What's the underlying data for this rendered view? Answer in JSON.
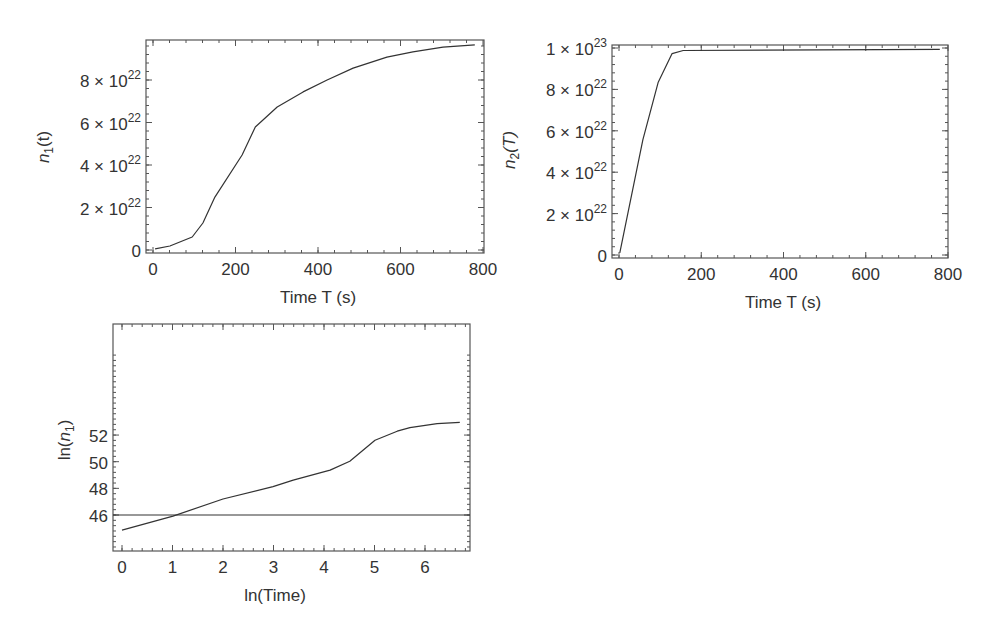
{
  "chart_data": [
    {
      "id": "n1",
      "type": "line",
      "title": "",
      "xlabel": "Time T (s)",
      "ylabel": "n1(t)",
      "ylabel_main": "n",
      "ylabel_sub": "1",
      "ylabel_tail": "(t)",
      "xlim": [
        0,
        800
      ],
      "ylim": [
        0,
        1e+23
      ],
      "xticks": [
        0,
        200,
        400,
        600,
        800
      ],
      "xtick_labels": [
        "0",
        "200",
        "400",
        "600",
        "800"
      ],
      "yticks": [
        0,
        2e+22,
        4e+22,
        6e+22,
        8e+22
      ],
      "ytick_labels": [
        {
          "mant": "0",
          "exp": ""
        },
        {
          "mant": "2 × 10",
          "exp": "22"
        },
        {
          "mant": "4 × 10",
          "exp": "22"
        },
        {
          "mant": "6 × 10",
          "exp": "22"
        },
        {
          "mant": "8 × 10",
          "exp": "22"
        }
      ],
      "grid": false,
      "legend": null,
      "series": [
        {
          "name": "n1",
          "x": [
            5,
            41,
            95,
            121,
            150,
            216,
            248,
            301,
            364,
            422,
            485,
            567,
            630,
            703,
            780
          ],
          "y": [
            5e+20,
            1.9e+21,
            6.1e+21,
            1.27e+22,
            2.49e+22,
            4.47e+22,
            5.79e+22,
            6.73e+22,
            7.44e+22,
            8e+22,
            8.56e+22,
            9.08e+22,
            9.32e+22,
            9.55e+22,
            9.65e+22
          ]
        }
      ]
    },
    {
      "id": "n2",
      "type": "line",
      "title": "",
      "xlabel": "Time T (s)",
      "ylabel": "n2(T)",
      "ylabel_main": "n",
      "ylabel_sub": "2",
      "ylabel_tail": "(T)",
      "xlim": [
        0,
        800
      ],
      "ylim": [
        0,
        1e+23
      ],
      "xticks": [
        0,
        200,
        400,
        600,
        800
      ],
      "xtick_labels": [
        "0",
        "200",
        "400",
        "600",
        "800"
      ],
      "yticks": [
        0,
        2e+22,
        4e+22,
        6e+22,
        8e+22,
        1e+23
      ],
      "ytick_labels": [
        {
          "mant": "0",
          "exp": ""
        },
        {
          "mant": "2 × 10",
          "exp": "22"
        },
        {
          "mant": "4 × 10",
          "exp": "22"
        },
        {
          "mant": "6 × 10",
          "exp": "22"
        },
        {
          "mant": "8 × 10",
          "exp": "22"
        },
        {
          "mant": "1 × 10",
          "exp": "23"
        }
      ],
      "grid": false,
      "legend": null,
      "series": [
        {
          "name": "n2",
          "x": [
            2,
            58,
            95,
            129,
            156,
            780
          ],
          "y": [
            1e+21,
            5.57e+22,
            8.33e+22,
            9.73e+22,
            9.88e+22,
            9.93e+22
          ]
        }
      ]
    },
    {
      "id": "ln_n1",
      "type": "line",
      "title": "",
      "xlabel": "ln(Time)",
      "ylabel": "ln(n1)",
      "ylabel_main": "ln(",
      "ylabel_italic": "n",
      "ylabel_sub": "1",
      "ylabel_tail": ")",
      "xlim": [
        -0.18,
        6.9
      ],
      "ylim": [
        44.7,
        53.35
      ],
      "xticks": [
        0,
        1,
        2,
        3,
        4,
        5,
        6
      ],
      "xtick_labels": [
        "0",
        "1",
        "2",
        "3",
        "4",
        "5",
        "6"
      ],
      "yticks": [
        46,
        48,
        50,
        52
      ],
      "ytick_labels": [
        {
          "mant": "46",
          "exp": ""
        },
        {
          "mant": "48",
          "exp": ""
        },
        {
          "mant": "50",
          "exp": ""
        },
        {
          "mant": "52",
          "exp": ""
        }
      ],
      "grid": false,
      "legend": null,
      "annotations": [
        {
          "type": "hline",
          "y": 46
        }
      ],
      "series": [
        {
          "name": "ln(n1)",
          "x": [
            0,
            1.01,
            2.0,
            2.99,
            3.39,
            4.12,
            4.51,
            5.01,
            5.45,
            5.7,
            6.24,
            6.69
          ],
          "y": [
            44.87,
            45.92,
            47.2,
            48.13,
            48.62,
            49.37,
            50.04,
            51.61,
            52.29,
            52.55,
            52.85,
            52.96
          ]
        }
      ]
    }
  ]
}
